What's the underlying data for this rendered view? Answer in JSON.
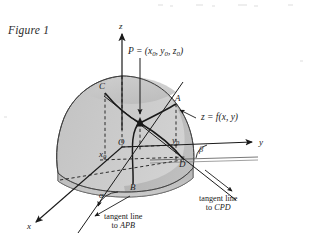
{
  "figure": {
    "caption": "Figure 1",
    "domain": "mathematics-textbook-diagram"
  },
  "axes": {
    "z_label": "z",
    "y_label": "y",
    "x_label": "x"
  },
  "labels": {
    "point_p_text": "P = (x",
    "point_p_sub1": "0",
    "point_p_mid1": ", y",
    "point_p_sub2": "0",
    "point_p_mid2": ", z",
    "point_p_sub3": "0",
    "point_p_end": ")",
    "surface_equation": "z = f(x, y)",
    "point_a": "A",
    "point_b": "B",
    "point_c": "C",
    "point_d": "D",
    "origin": "O",
    "x_naught": "x",
    "x_naught_sub": "0",
    "y_naught": "y",
    "y_naught_sub": "0",
    "angle_alpha": "α",
    "angle_beta": "β"
  },
  "annotations": {
    "tangent_apb_line1": "tangent line",
    "tangent_apb_line2_pre": "to ",
    "tangent_apb_line2_curve": "APB",
    "tangent_cpd_line1": "tangent line",
    "tangent_cpd_line2_pre": "to ",
    "tangent_cpd_line2_curve": "CPD"
  },
  "colors": {
    "surface_light": "#c9c9c9",
    "surface_mid": "#b3b3b3",
    "surface_dark": "#9c9c9c",
    "surface_base": "#d8d8d8",
    "ink": "#1a1a1a",
    "paper": "#ffffff"
  }
}
